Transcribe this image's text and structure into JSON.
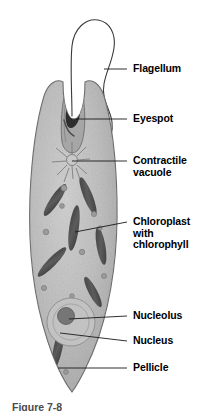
{
  "figure": {
    "organism": "Euglena",
    "caption_partial": "Figure 7-8",
    "background_color": "#ffffff",
    "line_color": "#1a1a1a",
    "body_fill": "#b9b9b9",
    "body_outline": "#6b6b6b",
    "organelle_dark": "#4a4a4a",
    "label_color": "#000000"
  },
  "labels": [
    {
      "id": "flagellum",
      "text": "Flagellum",
      "x": 133,
      "y": 63,
      "leader": {
        "x1": 127,
        "y1": 69,
        "x2": 104,
        "y2": 69
      }
    },
    {
      "id": "eyespot",
      "text": "Eyespot",
      "x": 133,
      "y": 113,
      "leader": {
        "x1": 127,
        "y1": 119,
        "x2": 71,
        "y2": 119
      }
    },
    {
      "id": "contractile-vacuole",
      "text": "Contractile\nvacuole",
      "x": 133,
      "y": 155,
      "leader": {
        "x1": 127,
        "y1": 161,
        "x2": 72,
        "y2": 161
      }
    },
    {
      "id": "chloroplast",
      "text": "Chloroplast\nwith\nchlorophyll",
      "x": 133,
      "y": 216,
      "leader": {
        "x1": 127,
        "y1": 222,
        "x2": 75,
        "y2": 232
      }
    },
    {
      "id": "nucleolus",
      "text": "Nucleolus",
      "x": 133,
      "y": 310,
      "leader": {
        "x1": 127,
        "y1": 316,
        "x2": 69,
        "y2": 319
      }
    },
    {
      "id": "nucleus",
      "text": "Nucleus",
      "x": 133,
      "y": 335,
      "leader": {
        "x1": 127,
        "y1": 341,
        "x2": 60,
        "y2": 333
      }
    },
    {
      "id": "pellicle",
      "text": "Pellicle",
      "x": 133,
      "y": 362,
      "leader": {
        "x1": 127,
        "y1": 368,
        "x2": 58,
        "y2": 368
      }
    }
  ],
  "structures": {
    "flagellum_name": "flagellum-curve",
    "body_name": "euglena-cell-body",
    "eyespot_name": "eyespot-organelle",
    "gullet_name": "gullet-reservoir",
    "vacuole_name": "contractile-vacuole-star",
    "nucleus_name": "nucleus-oval",
    "nucleolus_name": "nucleolus-circle",
    "chloroplast_count": 7,
    "granule_count": 12
  }
}
